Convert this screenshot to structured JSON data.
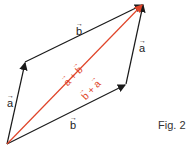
{
  "figure": {
    "caption": "Fig. 2",
    "colors": {
      "edge": "#1a1a1a",
      "diagonal": "#e0452a"
    },
    "vertices": {
      "origin": [
        7,
        144
      ],
      "left_mid": [
        25,
        62
      ],
      "right_mid": [
        126,
        84
      ],
      "top_right": [
        143,
        4
      ]
    },
    "labels": {
      "top_edge": "b",
      "bottom_edge": "b",
      "left_edge": "a",
      "right_edge": "a",
      "diag_upper": "a + b",
      "diag_lower": "b + a"
    },
    "vector_parts": {
      "diag_upper": [
        "a",
        " + ",
        "b"
      ],
      "diag_lower": [
        "b",
        " + ",
        "a"
      ]
    }
  }
}
